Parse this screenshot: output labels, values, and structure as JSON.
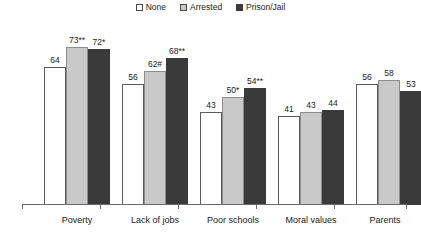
{
  "chart_data": {
    "type": "bar",
    "title": "",
    "subtitle": "",
    "xlabel": "",
    "ylabel": "",
    "ylim": [
      0,
      80
    ],
    "grid": false,
    "legend_position": "top-center",
    "categories": [
      "Poverty",
      "Lack of jobs",
      "Poor schools",
      "Moral values",
      "Parents"
    ],
    "series": [
      {
        "name": "None",
        "color": "#ffffff",
        "values": [
          64,
          56,
          43,
          41,
          56
        ],
        "labels": [
          "64",
          "56",
          "43",
          "41",
          "56"
        ]
      },
      {
        "name": "Arrested",
        "color": "#c9c9c9",
        "values": [
          73,
          62,
          50,
          43,
          58
        ],
        "labels": [
          "73**",
          "62#",
          "50*",
          "43",
          "58"
        ]
      },
      {
        "name": "Prison/Jail",
        "color": "#3a3a3a",
        "values": [
          72,
          68,
          54,
          44,
          53
        ],
        "labels": [
          "72*",
          "68**",
          "54**",
          "44",
          "53"
        ]
      }
    ]
  },
  "legend": {
    "items": [
      {
        "label": "None",
        "swatch": "legend-swatch-none"
      },
      {
        "label": "Arrested",
        "swatch": "legend-swatch-arrested"
      },
      {
        "label": "Prison/Jail",
        "swatch": "legend-swatch-prison-jail"
      }
    ]
  }
}
